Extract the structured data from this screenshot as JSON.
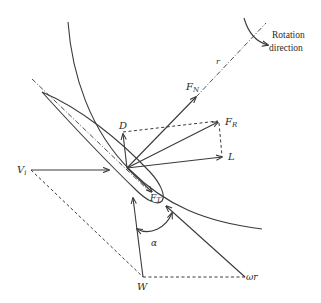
{
  "diagram": {
    "labels": {
      "rotation_line1": "Rotation",
      "rotation_line2": "direction",
      "r": "r",
      "FN_main": "F",
      "FN_sub": "N",
      "FR_main": "F",
      "FR_sub": "R",
      "FT_main": "F",
      "FT_sub": "T",
      "D": "D",
      "L": "L",
      "Vi_main": "V",
      "Vi_sub": "i",
      "W": "W",
      "omega_r": "ωr",
      "alpha": "α"
    },
    "colors": {
      "stroke": "#3a3a3a",
      "text": "#2b2b2b",
      "background": "#ffffff"
    }
  }
}
